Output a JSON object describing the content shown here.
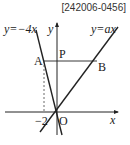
{
  "reference_id": "[242006-0456]",
  "axes": {
    "x_label": "x",
    "y_label": "y",
    "origin_label": "O",
    "tick_label": "−2"
  },
  "lines": [
    {
      "name": "steep-line",
      "equation": "y=−4x",
      "slope": -4
    },
    {
      "name": "ax-line",
      "equation": "y=ax",
      "slope_symbol": "a"
    }
  ],
  "points": {
    "A": {
      "label": "A",
      "x": -2,
      "y": 8
    },
    "P": {
      "label": "P",
      "x": 0,
      "y": 8
    },
    "B": {
      "label": "B"
    }
  },
  "colors": {
    "stroke": "#222222",
    "background": "#ffffff"
  }
}
